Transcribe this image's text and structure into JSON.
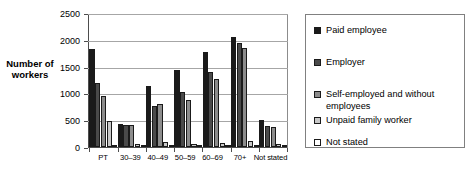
{
  "chart_data": {
    "type": "bar",
    "title": "",
    "xlabel": "",
    "ylabel": "Number of workers",
    "ylim": [
      0,
      2500
    ],
    "ytick_step": 500,
    "yticks": [
      "2500",
      "2000",
      "1500",
      "1000",
      "500",
      "0"
    ],
    "grid": true,
    "legend_position": "right",
    "categories": [
      "PT",
      "30–39",
      "40–49",
      "50–59",
      "60–69",
      "70+",
      "Not stated"
    ],
    "series": [
      {
        "name": "Paid employee",
        "color": "#1a1a1a",
        "values": [
          1840,
          430,
          1150,
          1450,
          1790,
          2060,
          500
        ]
      },
      {
        "name": "Employer",
        "color": "#4a4a4a",
        "values": [
          1210,
          405,
          770,
          1030,
          1410,
          1950,
          400
        ]
      },
      {
        "name": "Self-employed and without employees",
        "color": "#8c8c8c",
        "values": [
          960,
          410,
          810,
          880,
          1280,
          1870,
          370
        ]
      },
      {
        "name": "Unpaid family worker",
        "color": "#c8c8c8",
        "values": [
          490,
          60,
          95,
          60,
          70,
          110,
          55
        ]
      },
      {
        "name": "Not stated",
        "color": "#ffffff",
        "values": [
          20,
          10,
          15,
          15,
          20,
          30,
          20
        ]
      }
    ]
  },
  "legend": {
    "items": [
      {
        "label": "Paid employee",
        "color": "#1a1a1a"
      },
      {
        "label": "Employer",
        "color": "#4a4a4a"
      },
      {
        "label": "Self-employed and without employees",
        "color": "#8c8c8c"
      },
      {
        "label": "Unpaid family worker",
        "color": "#c8c8c8"
      },
      {
        "label": "Not stated",
        "color": "#ffffff"
      }
    ]
  },
  "axis": {
    "y_title": "Number of workers"
  }
}
